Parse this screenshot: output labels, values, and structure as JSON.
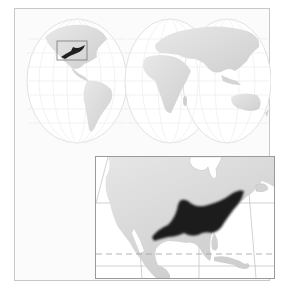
{
  "figure": {
    "type": "species-range-map",
    "world_map": {
      "projection": "interrupted-goode-homolosine",
      "highlight_region": "eastern-north-america"
    },
    "inset_map": {
      "region": "north-america",
      "range_description": "eastern-united-states",
      "tropic_line": "tropic-of-cancer"
    },
    "colors": {
      "background": "#ffffff",
      "frame": "#c8c8c8",
      "land": "#d9d9d9",
      "graticule": "#e6e6e6",
      "range": "#1f1f1f",
      "inset_border": "#9a9a9a",
      "tropic_dash": "#a0a0a0"
    }
  }
}
